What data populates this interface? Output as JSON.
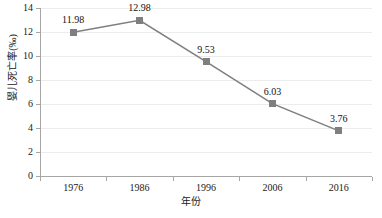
{
  "chart_data": {
    "type": "line",
    "title": "",
    "xlabel": "年份",
    "ylabel": "婴儿死亡率(‰)",
    "categories": [
      "1976",
      "1986",
      "1996",
      "2006",
      "2016"
    ],
    "values": [
      11.98,
      12.98,
      9.53,
      6.03,
      3.76
    ],
    "point_labels": [
      "11.98",
      "12.98",
      "9.53",
      "6.03",
      "3.76"
    ],
    "ylim": [
      0,
      14
    ],
    "ytick_step": 2,
    "yticks": [
      "0",
      "2",
      "4",
      "6",
      "8",
      "10",
      "12",
      "14"
    ],
    "grid": "horizontal",
    "legend": "none",
    "series": [
      {
        "name": "婴儿死亡率(‰)",
        "values": [
          11.98,
          12.98,
          9.53,
          6.03,
          3.76
        ],
        "line_color": "#7f7f7f",
        "marker_color": "#7f7f7f",
        "marker_shape": "square"
      }
    ],
    "colors": {
      "line": "#7f7f7f",
      "marker": "#7f7f7f",
      "grid": "#ececec",
      "axis": "#a6a6a6",
      "text": "#1a1a1a",
      "background": "#ffffff"
    }
  }
}
